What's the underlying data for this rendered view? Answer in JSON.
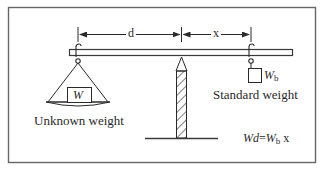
{
  "diagram": {
    "dimensions": {
      "left_arm_label": "d",
      "right_arm_label": "x"
    },
    "left_load": {
      "box_label": "W",
      "caption": "Unknown weight"
    },
    "right_load": {
      "label_main": "W",
      "label_sub": "b",
      "caption": "Standard weight"
    },
    "formula": {
      "lhs": "Wd",
      "equals": "=",
      "rhs_main": "W",
      "rhs_sub": "b",
      "rhs_tail": " x",
      "full_text": "Wd = Wb x"
    },
    "colors": {
      "stroke": "#3a3a3a",
      "border": "#555555",
      "background": "#ffffff"
    }
  }
}
